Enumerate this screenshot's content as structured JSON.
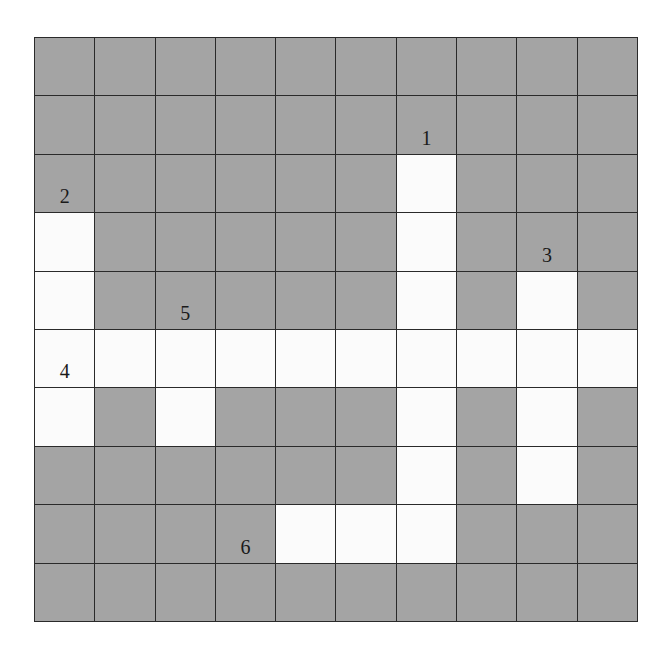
{
  "puzzle": {
    "type": "crossword-grid",
    "rows": 10,
    "cols": 10,
    "colors": {
      "blocked": "#a4a4a4",
      "open": "#fbfbfb",
      "line": "#2a2a2a"
    },
    "open_cells": [
      [
        2,
        6
      ],
      [
        3,
        0
      ],
      [
        3,
        6
      ],
      [
        4,
        0
      ],
      [
        4,
        6
      ],
      [
        4,
        8
      ],
      [
        5,
        0
      ],
      [
        5,
        1
      ],
      [
        5,
        2
      ],
      [
        5,
        3
      ],
      [
        5,
        4
      ],
      [
        5,
        5
      ],
      [
        5,
        6
      ],
      [
        5,
        7
      ],
      [
        5,
        8
      ],
      [
        5,
        9
      ],
      [
        6,
        0
      ],
      [
        6,
        2
      ],
      [
        6,
        6
      ],
      [
        6,
        8
      ],
      [
        7,
        6
      ],
      [
        7,
        8
      ],
      [
        8,
        4
      ],
      [
        8,
        5
      ],
      [
        8,
        6
      ]
    ],
    "labels": [
      {
        "number": "1",
        "row": 1,
        "col": 6
      },
      {
        "number": "2",
        "row": 2,
        "col": 0
      },
      {
        "number": "3",
        "row": 3,
        "col": 8
      },
      {
        "number": "5",
        "row": 4,
        "col": 2
      },
      {
        "number": "4",
        "row": 5,
        "col": 0
      },
      {
        "number": "6",
        "row": 8,
        "col": 3
      }
    ]
  }
}
